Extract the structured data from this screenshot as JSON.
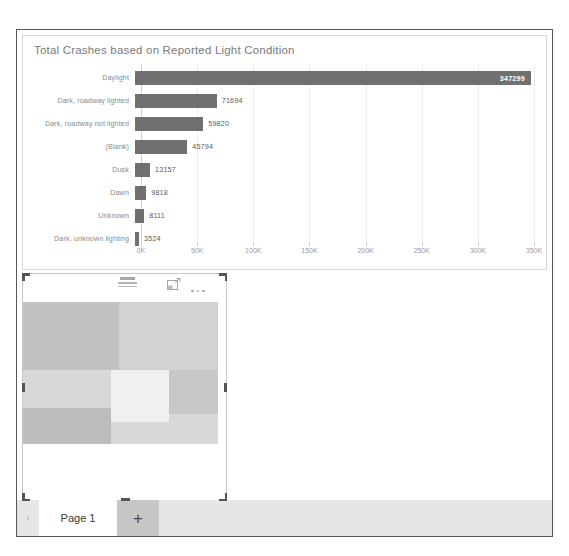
{
  "app": {
    "page_tabs": {
      "prev_label": "›",
      "tabs": [
        {
          "label": "Page 1"
        }
      ],
      "add_label": "+"
    }
  },
  "visual2": {
    "name": "placeholder-visual",
    "header_icons": [
      {
        "name": "filter-icon",
        "label": "Filters"
      },
      {
        "name": "focus-mode-icon",
        "label": "Focus mode"
      },
      {
        "name": "more-options-icon",
        "label": "More options"
      }
    ],
    "blocks": [
      {
        "left": 0,
        "top": 8,
        "width": 96,
        "height": 68,
        "color": "#c2c2c2"
      },
      {
        "left": 96,
        "top": 8,
        "width": 99,
        "height": 68,
        "color": "#d2d2d2"
      },
      {
        "left": 0,
        "top": 76,
        "width": 88,
        "height": 38,
        "color": "#d8d8d8"
      },
      {
        "left": 88,
        "top": 76,
        "width": 58,
        "height": 52,
        "color": "#f0f0f0"
      },
      {
        "left": 146,
        "top": 76,
        "width": 49,
        "height": 44,
        "color": "#c8c8c8"
      },
      {
        "left": 0,
        "top": 114,
        "width": 88,
        "height": 36,
        "color": "#bcbcbc"
      },
      {
        "left": 88,
        "top": 128,
        "width": 107,
        "height": 22,
        "color": "#d8d8d8"
      },
      {
        "left": 146,
        "top": 120,
        "width": 49,
        "height": 8,
        "color": "#d8d8d8"
      }
    ]
  },
  "chart_data": {
    "type": "bar",
    "orientation": "horizontal",
    "title": "Total Crashes based on Reported Light Condition",
    "xlabel": "",
    "ylabel": "",
    "categories": [
      "Daylight",
      "Dark, roadway lighted",
      "Dark, roadway not lighted",
      "(Blank)",
      "Dusk",
      "Dawn",
      "Unknown",
      "Dark, unknown lighting"
    ],
    "values": [
      347299,
      71694,
      59820,
      45794,
      13157,
      9818,
      8111,
      3524
    ],
    "value_labels": [
      "347299",
      "71694",
      "59820",
      "45794",
      "13157",
      "9818",
      "8111",
      "3524"
    ],
    "xlim": [
      0,
      350000
    ],
    "xticks": [
      0,
      50000,
      100000,
      150000,
      200000,
      250000,
      300000,
      350000
    ],
    "xticklabels": [
      "0K",
      "50K",
      "100K",
      "150K",
      "200K",
      "250K",
      "300K",
      "350K"
    ],
    "grid": true,
    "legend": false,
    "bar_color": "#707070",
    "label_color": "#8a8a8a"
  }
}
